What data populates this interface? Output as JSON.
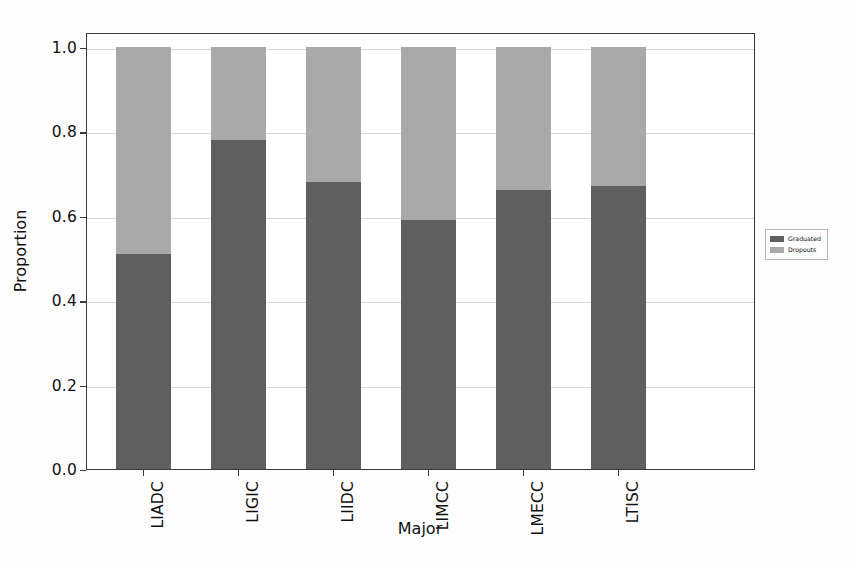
{
  "chart_data": {
    "type": "bar",
    "subtype": "stacked-100-percent",
    "title": "",
    "xlabel": "Major",
    "ylabel": "Proportion",
    "categories": [
      "LIADC",
      "LIGIC",
      "LIIDC",
      "LIMCC",
      "LMECC",
      "LTISC"
    ],
    "series": [
      {
        "name": "Graduated",
        "color": "#5f5f5f",
        "values": [
          0.51,
          0.78,
          0.68,
          0.59,
          0.66,
          0.67
        ]
      },
      {
        "name": "Dropouts",
        "color": "#a9a9a9",
        "values": [
          0.49,
          0.22,
          0.32,
          0.41,
          0.34,
          0.33
        ]
      }
    ],
    "ylim": [
      0.0,
      1.0
    ],
    "y_ticks": [
      "0.0",
      "0.2",
      "0.4",
      "0.6",
      "0.8",
      "1.0"
    ],
    "y_tick_values": [
      0.0,
      0.2,
      0.4,
      0.6,
      0.8,
      1.0
    ],
    "grid": true,
    "grid_axis": "y",
    "legend_position": "right-outside",
    "legend_entries": [
      "Graduated",
      "Dropouts"
    ],
    "x_tick_rotation": -90
  },
  "figure": {
    "background_color": "#fdfdfd",
    "plot_background_color": "#ffffff",
    "frame_color": "#3a3a3a",
    "gridline_color": "#d8d8d8"
  }
}
